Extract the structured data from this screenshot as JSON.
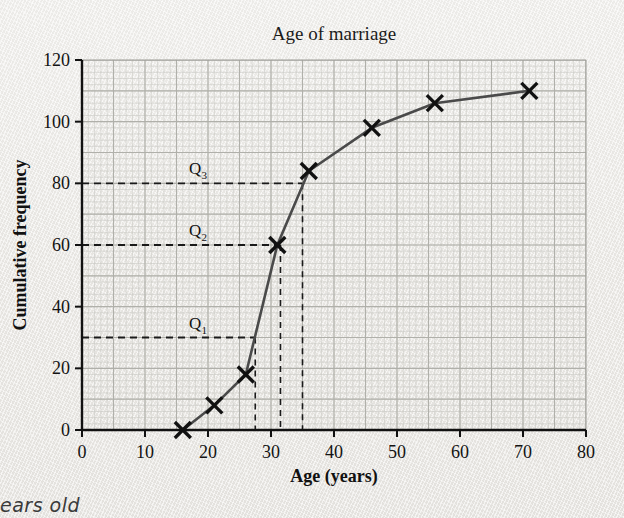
{
  "chart_data": {
    "type": "line",
    "title": "Age of marriage",
    "xlabel": "Age (years)",
    "ylabel": "Cumulative frequency",
    "xlim": [
      0,
      80
    ],
    "ylim": [
      0,
      120
    ],
    "xticks": [
      "0",
      "10",
      "20",
      "30",
      "40",
      "50",
      "60",
      "70",
      "80"
    ],
    "xtick_values": [
      0,
      10,
      20,
      30,
      40,
      50,
      60,
      70,
      80
    ],
    "yticks": [
      "0",
      "20",
      "40",
      "60",
      "80",
      "100",
      "120"
    ],
    "ytick_values": [
      0,
      20,
      40,
      60,
      80,
      100,
      120
    ],
    "grid": true,
    "grid_minor_step_x": 1,
    "grid_minor_step_y": 2,
    "grid_major_step_x": 5,
    "grid_major_step_y": 10,
    "legend": "none",
    "marker": "x-cross",
    "series": [
      {
        "name": "Cumulative frequency",
        "points": [
          {
            "x": 16,
            "y": 0
          },
          {
            "x": 21,
            "y": 8
          },
          {
            "x": 26,
            "y": 18
          },
          {
            "x": 31,
            "y": 60
          },
          {
            "x": 36,
            "y": 84
          },
          {
            "x": 46,
            "y": 98
          },
          {
            "x": 56,
            "y": 106
          },
          {
            "x": 71,
            "y": 110
          }
        ]
      }
    ],
    "annotations": [
      {
        "label": "Q",
        "sub": "3",
        "cf": 80,
        "age": 35,
        "label_x": 17,
        "style": "dashed-guide"
      },
      {
        "label": "Q",
        "sub": "2",
        "cf": 60,
        "age": 31.5,
        "label_x": 17,
        "style": "dashed-guide"
      },
      {
        "label": "Q",
        "sub": "1",
        "cf": 30,
        "age": 27.5,
        "label_x": 17,
        "style": "dashed-guide"
      }
    ]
  },
  "marginalia": {
    "handwritten_note": "ears old"
  },
  "colors": {
    "paper": "#eeeeea",
    "axis": "#111111",
    "curve": "#4a4a4a",
    "marker": "#111111",
    "grid_minor": "#c9c9c4",
    "grid_major": "#b0b0aa",
    "dashed": "#1a1a1a",
    "text": "#131313",
    "note": "#3a3a3a"
  }
}
